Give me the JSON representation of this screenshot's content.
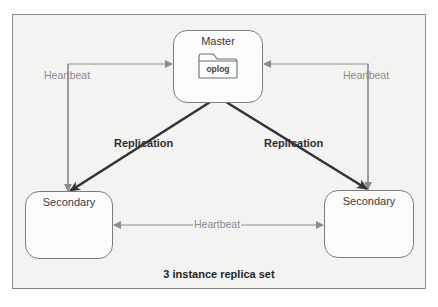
{
  "diagram": {
    "caption": "3 instance replica set",
    "nodes": {
      "master": {
        "label": "Master",
        "icon": "folder-icon",
        "icon_label": "oplog"
      },
      "secondary_left": {
        "label": "Secondary"
      },
      "secondary_right": {
        "label": "Secondary"
      }
    },
    "edges": {
      "heartbeat_left": {
        "label": "Heartbeat",
        "from": "secondary_left",
        "to": "master",
        "style": "thin-gray"
      },
      "heartbeat_right": {
        "label": "Heartbeat",
        "from": "secondary_right",
        "to": "master",
        "style": "thin-gray"
      },
      "heartbeat_bottom": {
        "label": "Heartbeat",
        "from": "secondary_left",
        "to": "secondary_right",
        "bidirectional": true,
        "style": "thin-gray"
      },
      "replication_left": {
        "label": "Replication",
        "from": "master",
        "to": "secondary_left",
        "style": "thick-dark"
      },
      "replication_right": {
        "label": "Replication",
        "from": "master",
        "to": "secondary_right",
        "style": "thick-dark"
      }
    },
    "colors": {
      "frame_border": "#8a8a8a",
      "frame_fill": "#f3f3f2",
      "heartbeat_line": "#8c8c8c",
      "replication_line": "#333333",
      "node_border": "#7d7d7d"
    }
  }
}
